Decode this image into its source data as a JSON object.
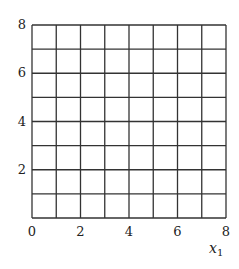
{
  "chart_data": {
    "type": "scatter",
    "title": "",
    "xlabel": "x1",
    "ylabel": "",
    "xlim": [
      0,
      8
    ],
    "ylim": [
      0,
      8
    ],
    "grid": true,
    "grid_step": 1,
    "x_ticks": [
      "0",
      "2",
      "4",
      "6",
      "8"
    ],
    "y_ticks": [
      "2",
      "4",
      "6",
      "8"
    ],
    "series": [],
    "legend": null
  },
  "labels": {
    "xlabel_main": "x",
    "xlabel_sub": "1"
  },
  "colors": {
    "grid": "#333333",
    "text": "#222222",
    "background": "#ffffff"
  }
}
